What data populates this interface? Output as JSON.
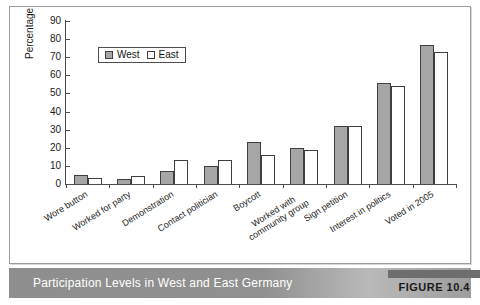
{
  "figure": {
    "caption": "Participation Levels in West and East Germany",
    "badge_label": "FIGURE 10.4"
  },
  "colors": {
    "west_fill": "#a6a6a6",
    "east_fill": "#ffffff",
    "bar_stroke": "#3f3f3f",
    "axis": "#4d4d4d",
    "caption_bar": "#909090",
    "caption_text": "#ffffff",
    "badge": "#6e6e6e"
  },
  "chart_data": {
    "type": "bar",
    "title": "",
    "xlabel": "",
    "ylabel": "Percentage",
    "ylim": [
      0,
      90
    ],
    "yticks": [
      0,
      10,
      20,
      30,
      40,
      50,
      60,
      70,
      80,
      90
    ],
    "grid": false,
    "legend_position": "upper-left-inside",
    "categories": [
      "Wore button",
      "Worked for party",
      "Demonstration",
      "Contact politician",
      "Boycott",
      "Worked with community group",
      "Sign petition",
      "Interest in politics",
      "Voted in 2005"
    ],
    "series": [
      {
        "name": "West",
        "values": [
          5,
          3,
          7,
          10,
          23,
          20,
          32,
          56,
          77
        ]
      },
      {
        "name": "East",
        "values": [
          3.5,
          4.5,
          13,
          13,
          16,
          19,
          32,
          54,
          73
        ]
      }
    ]
  }
}
